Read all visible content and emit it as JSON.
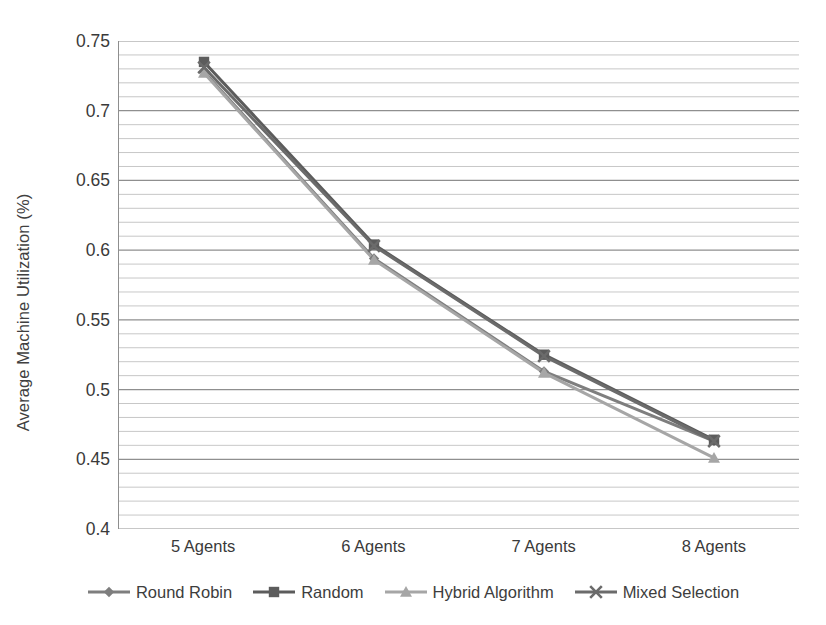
{
  "chart_data": {
    "type": "line",
    "title": "",
    "xlabel": "",
    "ylabel": "Average Machine Utilization (%)",
    "categories": [
      "5 Agents",
      "6 Agents",
      "7 Agents",
      "8 Agents"
    ],
    "ylim": [
      0.4,
      0.75
    ],
    "ytick_labels": [
      "0.4",
      "0.45",
      "0.5",
      "0.55",
      "0.6",
      "0.65",
      "0.7",
      "0.75"
    ],
    "ytick_values": [
      0.4,
      0.45,
      0.5,
      0.55,
      0.6,
      0.65,
      0.7,
      0.75
    ],
    "minor_gridline_step": 0.01,
    "grid": "horizontal-major-and-minor",
    "legend_position": "bottom",
    "series": [
      {
        "name": "Round Robin",
        "marker": "diamond",
        "color": "#7e7e7e",
        "values": [
          0.728,
          0.594,
          0.513,
          0.463
        ]
      },
      {
        "name": "Random",
        "marker": "square",
        "color": "#5c5c5c",
        "values": [
          0.735,
          0.604,
          0.525,
          0.464
        ]
      },
      {
        "name": "Hybrid Algorithm",
        "marker": "triangle",
        "color": "#a6a6a6",
        "values": [
          0.727,
          0.593,
          0.512,
          0.451
        ]
      },
      {
        "name": "Mixed Selection",
        "marker": "x",
        "color": "#6b6b6b",
        "values": [
          0.731,
          0.603,
          0.524,
          0.463
        ]
      }
    ]
  },
  "axis": {
    "y_title": "Average Machine Utilization (%)"
  },
  "legend": {
    "items": [
      {
        "label": "Round Robin"
      },
      {
        "label": "Random"
      },
      {
        "label": "Hybrid Algorithm"
      },
      {
        "label": "Mixed Selection"
      }
    ]
  }
}
